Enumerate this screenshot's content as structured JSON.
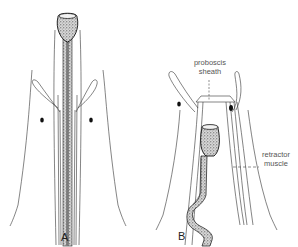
{
  "figure": {
    "panels": [
      {
        "id": "A",
        "label": "A",
        "state": "proboscis extended"
      },
      {
        "id": "B",
        "label": "B",
        "state": "proboscis retracted"
      }
    ],
    "annotations": {
      "proboscis_sheath": {
        "line1": "proboscis",
        "line2": "sheath"
      },
      "retractor_muscle": {
        "line1": "retractor",
        "line2": "muscle"
      }
    },
    "colors": {
      "background": "#ffffff",
      "ink": "#222222",
      "stipple": "#444444",
      "label": "#555555"
    }
  }
}
